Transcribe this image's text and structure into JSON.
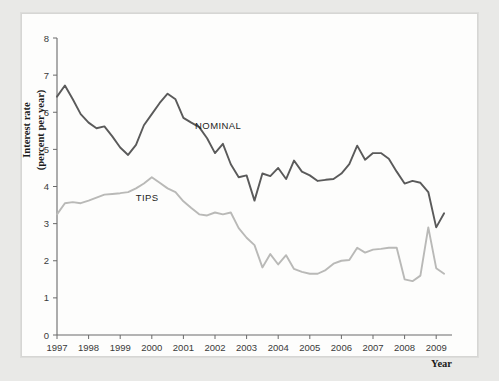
{
  "figure": {
    "background_color": "#e9e9e7",
    "plate_color": "#fdfdfc"
  },
  "chart_data": {
    "type": "line",
    "title": "",
    "xlabel": "Year",
    "ylabel": "Interest rate (percent per year)",
    "ylabel_line1": "Interest rate",
    "ylabel_line2": "(percent per year)",
    "xlim": [
      1997.0,
      2009.5
    ],
    "ylim": [
      0,
      8
    ],
    "yticks": [
      0,
      1,
      2,
      3,
      4,
      5,
      6,
      7,
      8
    ],
    "ytick_labels": [
      "0",
      "1",
      "2",
      "3",
      "4",
      "5",
      "6",
      "7",
      "8"
    ],
    "xticks": [
      1997,
      1998,
      1999,
      2000,
      2001,
      2002,
      2003,
      2004,
      2005,
      2006,
      2007,
      2008,
      2009
    ],
    "xtick_labels": [
      "1997",
      "1998",
      "1999",
      "2000",
      "2001",
      "2002",
      "2003",
      "2004",
      "2005",
      "2006",
      "2007",
      "2008",
      "2009"
    ],
    "grid": false,
    "legend_position": "inline-annotations",
    "annotations": [
      {
        "text": "NOMINAL",
        "x": 2002.1,
        "y": 5.55,
        "color": "#1d1d1d"
      },
      {
        "text": "TIPS",
        "x": 1999.85,
        "y": 3.62,
        "color": "#1d1d1d"
      }
    ],
    "series": [
      {
        "name": "NOMINAL",
        "color": "#5a5a5a",
        "width": 1.9,
        "x": [
          1997.0,
          1997.25,
          1997.5,
          1997.75,
          1998.0,
          1998.25,
          1998.5,
          1998.75,
          1999.0,
          1999.25,
          1999.5,
          1999.75,
          2000.0,
          2000.25,
          2000.5,
          2000.75,
          2001.0,
          2001.25,
          2001.5,
          2001.75,
          2002.0,
          2002.25,
          2002.5,
          2002.75,
          2003.0,
          2003.25,
          2003.5,
          2003.75,
          2004.0,
          2004.25,
          2004.5,
          2004.75,
          2005.0,
          2005.25,
          2005.5,
          2005.75,
          2006.0,
          2006.25,
          2006.5,
          2006.75,
          2007.0,
          2007.25,
          2007.5,
          2007.75,
          2008.0,
          2008.25,
          2008.5,
          2008.75,
          2009.0,
          2009.25
        ],
        "values": [
          6.42,
          6.72,
          6.35,
          5.95,
          5.72,
          5.57,
          5.62,
          5.35,
          5.05,
          4.85,
          5.12,
          5.65,
          5.95,
          6.25,
          6.5,
          6.35,
          5.85,
          5.72,
          5.6,
          5.3,
          4.9,
          5.15,
          4.6,
          4.25,
          4.3,
          3.62,
          4.35,
          4.28,
          4.5,
          4.2,
          4.7,
          4.4,
          4.3,
          4.15,
          4.18,
          4.2,
          4.35,
          4.6,
          5.1,
          4.72,
          4.9,
          4.9,
          4.75,
          4.4,
          4.08,
          4.15,
          4.1,
          3.85,
          2.9,
          3.28
        ]
      },
      {
        "name": "TIPS",
        "color": "#b9b9b7",
        "width": 1.9,
        "x": [
          1997.0,
          1997.25,
          1997.5,
          1997.75,
          1998.0,
          1998.25,
          1998.5,
          1998.75,
          1999.0,
          1999.25,
          1999.5,
          1999.75,
          2000.0,
          2000.25,
          2000.5,
          2000.75,
          2001.0,
          2001.25,
          2001.5,
          2001.75,
          2002.0,
          2002.25,
          2002.5,
          2002.75,
          2003.0,
          2003.25,
          2003.5,
          2003.75,
          2004.0,
          2004.25,
          2004.5,
          2004.75,
          2005.0,
          2005.25,
          2005.5,
          2005.75,
          2006.0,
          2006.25,
          2006.5,
          2006.75,
          2007.0,
          2007.25,
          2007.5,
          2007.75,
          2008.0,
          2008.25,
          2008.5,
          2008.75,
          2009.0,
          2009.25
        ],
        "values": [
          3.25,
          3.55,
          3.58,
          3.55,
          3.62,
          3.7,
          3.78,
          3.8,
          3.82,
          3.85,
          3.95,
          4.08,
          4.25,
          4.1,
          3.95,
          3.85,
          3.6,
          3.42,
          3.25,
          3.22,
          3.3,
          3.25,
          3.3,
          2.88,
          2.62,
          2.42,
          1.82,
          2.18,
          1.9,
          2.15,
          1.78,
          1.7,
          1.65,
          1.65,
          1.75,
          1.92,
          2.0,
          2.02,
          2.35,
          2.22,
          2.3,
          2.32,
          2.35,
          2.35,
          1.5,
          1.45,
          1.6,
          2.9,
          1.8,
          1.65
        ]
      }
    ]
  }
}
